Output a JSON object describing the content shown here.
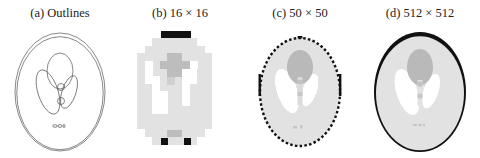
{
  "figure": {
    "panels": [
      {
        "id": "a",
        "title": "(a) Outlines",
        "kind": "outlines"
      },
      {
        "id": "b",
        "title": "(b) 16 × 16",
        "kind": "raster",
        "resolution": 16
      },
      {
        "id": "c",
        "title": "(c) 50 × 50",
        "kind": "raster",
        "resolution": 50
      },
      {
        "id": "d",
        "title": "(d) 512 × 512",
        "kind": "raster",
        "resolution": 512
      }
    ],
    "colors": {
      "background": "#ffffff",
      "skull": "#111111",
      "brain": "#e2e2e2",
      "ventricles": "#ffffff",
      "center_blob": "#b9b9b9",
      "small_features": "#c8c8c8",
      "outline_stroke": "#444444"
    }
  }
}
